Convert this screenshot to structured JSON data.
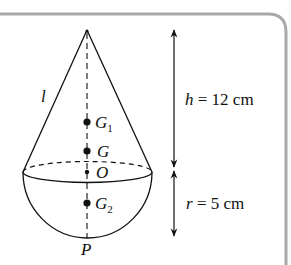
{
  "figure": {
    "type": "composite-solid",
    "colors": {
      "ink": "#111111",
      "frame": "#a8a8a8",
      "background": "#ffffff"
    }
  },
  "labels": {
    "slant": "l",
    "g1_letter": "G",
    "g1_sub": "1",
    "g": "G",
    "o": "O",
    "g2_letter": "G",
    "g2_sub": "2",
    "p": "P"
  },
  "dimensions": {
    "height": {
      "symbol": "h",
      "eq": " = 12 cm",
      "value": 12,
      "unit": "cm"
    },
    "radius": {
      "symbol": "r",
      "eq": " = 5 cm",
      "value": 5,
      "unit": "cm"
    }
  }
}
